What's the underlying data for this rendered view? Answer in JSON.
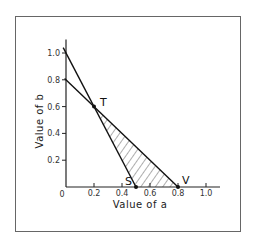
{
  "chart_data": {
    "type": "line",
    "title": "",
    "xlabel": "Value of a",
    "ylabel": "Value of b",
    "xlim": [
      0,
      1.1
    ],
    "ylim": [
      0,
      1.1
    ],
    "origin_label": "0",
    "x_ticks": [
      {
        "value": 0.2,
        "label": "0.2"
      },
      {
        "value": 0.4,
        "label": "0.4"
      },
      {
        "value": 0.6,
        "label": "0.6"
      },
      {
        "value": 0.8,
        "label": "0.8"
      },
      {
        "value": 1.0,
        "label": "1.0"
      }
    ],
    "y_ticks": [
      {
        "value": 0.2,
        "label": "0.2"
      },
      {
        "value": 0.4,
        "label": "0.4"
      },
      {
        "value": 0.6,
        "label": "0.6"
      },
      {
        "value": 0.8,
        "label": "0.8"
      },
      {
        "value": 1.0,
        "label": "1.0"
      }
    ],
    "series": [
      {
        "name": "line-b-equals-1-minus-2a",
        "x": [
          -0.02,
          0.5
        ],
        "y": [
          1.04,
          0.0
        ]
      },
      {
        "name": "line-b-equals-0.8-minus-a",
        "x": [
          -0.01,
          0.8
        ],
        "y": [
          0.81,
          0.0
        ]
      }
    ],
    "points": [
      {
        "label": "T",
        "x": 0.2,
        "y": 0.6
      },
      {
        "label": "S",
        "x": 0.5,
        "y": 0.0
      },
      {
        "label": "V",
        "x": 0.8,
        "y": 0.0
      }
    ],
    "shaded_region": {
      "vertices": [
        "T",
        "S",
        "V"
      ],
      "pattern": "diagonal-hatch"
    },
    "grid": false,
    "legend": "none"
  }
}
